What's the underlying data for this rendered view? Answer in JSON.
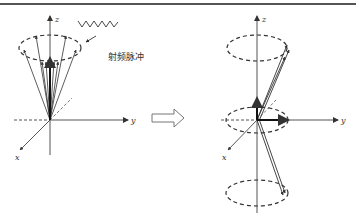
{
  "figure": {
    "left_panel": {
      "axis_labels": {
        "z": "z",
        "y": "y",
        "x": "x"
      },
      "annotation": "射频脉冲",
      "annotation_meaning": "RF pulse"
    },
    "right_panel": {
      "axis_labels": {
        "z": "z",
        "y": "y",
        "x": "x"
      }
    },
    "transition_arrow": "hollow-right-arrow"
  },
  "colors": {
    "line": "#333333",
    "background": "#ffffff"
  }
}
